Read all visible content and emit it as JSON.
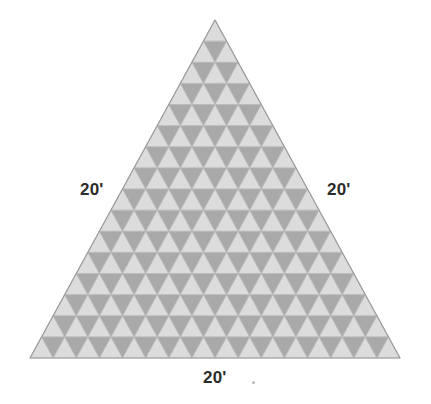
{
  "figure": {
    "name": "subdivided-equilateral-triangle",
    "type": "geometry-diagram",
    "background_color": "#ffffff"
  },
  "diagram_data": {
    "type": "geometric-figure",
    "shape": "equilateral triangle",
    "subdivision": {
      "rows": 16,
      "small_triangles_total": 256,
      "upward_triangles": 136,
      "downward_triangles": 120,
      "row_counts_upward": [
        1,
        2,
        3,
        4,
        5,
        6,
        7,
        8,
        9,
        10,
        11,
        12,
        13,
        14,
        15,
        16
      ]
    },
    "vertices": {
      "apex": [
        215,
        20
      ],
      "bottom_left": [
        30,
        358
      ],
      "bottom_right": [
        400,
        358
      ]
    },
    "side_length_px": 370,
    "colors": {
      "upward_fill": "#dcdcdc",
      "downward_fill": "#a9a9a9",
      "outline": "#bdbdbd",
      "outer_border": "#9a9a9a",
      "label_text": "#2b2b2b"
    },
    "labels": [
      {
        "side": "left",
        "text": "20'"
      },
      {
        "side": "right",
        "text": "20'"
      },
      {
        "side": "bottom",
        "text": "20'"
      }
    ]
  },
  "labels": {
    "left": "20'",
    "right": "20'",
    "bottom": "20'"
  }
}
